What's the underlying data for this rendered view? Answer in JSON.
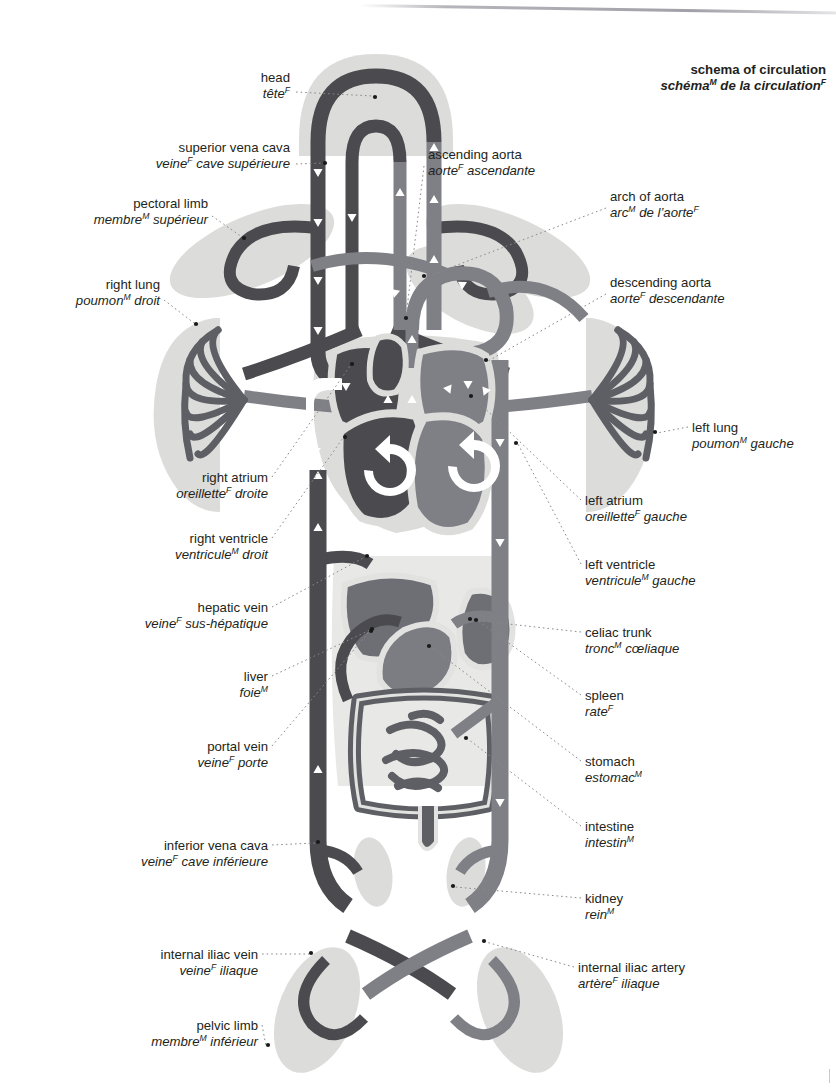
{
  "title": {
    "en": "schema of circulation",
    "fr_pre": "schéma",
    "fr_sup": "M",
    "fr_post": " de la circulation",
    "fr_sup2": "F"
  },
  "palette": {
    "vein": "#4a4a4f",
    "artery": "#7f7f86",
    "organ_dark": "#5c5c62",
    "organ_mid": "#77777e",
    "tissue": "#dcdcda",
    "tissue_light": "#e6e6e4",
    "outline_light": "#c9c9c6",
    "arrow": "#ffffff",
    "text": "#231f20",
    "background": "#ffffff",
    "leader": "#8a8a8a"
  },
  "labels_left": [
    {
      "name": "head",
      "en": "head",
      "fr": "tête",
      "sup": "F",
      "fr_pre": "",
      "x": 290,
      "y": 70,
      "dot_x": 375,
      "dot_y": 97
    },
    {
      "name": "superior-vena-cava",
      "en": "superior vena cava",
      "fr": "cave supérieure",
      "sup": "F",
      "fr_pre": "veine",
      "x": 290,
      "y": 140,
      "dot_x": 325,
      "dot_y": 163
    },
    {
      "name": "pectoral-limb",
      "en": "pectoral limb",
      "fr": "supérieur",
      "sup": "M",
      "fr_pre": "membre",
      "x": 208,
      "y": 196,
      "dot_x": 244,
      "dot_y": 238
    },
    {
      "name": "right-lung",
      "en": "right lung",
      "fr": "droit",
      "sup": "M",
      "fr_pre": "poumon",
      "x": 160,
      "y": 277,
      "dot_x": 196,
      "dot_y": 324
    },
    {
      "name": "right-atrium",
      "en": "right atrium",
      "fr": "droite",
      "sup": "F",
      "fr_pre": "oreillette",
      "x": 268,
      "y": 470,
      "dot_x": 352,
      "dot_y": 364
    },
    {
      "name": "right-ventricle",
      "en": "right ventricle",
      "fr": "droit",
      "sup": "M",
      "fr_pre": "ventricule",
      "x": 268,
      "y": 531,
      "dot_x": 345,
      "dot_y": 437
    },
    {
      "name": "hepatic-vein",
      "en": "hepatic vein",
      "fr": "sus-hépatique",
      "sup": "F",
      "fr_pre": "veine",
      "x": 268,
      "y": 600,
      "dot_x": 367,
      "dot_y": 556
    },
    {
      "name": "liver",
      "en": "liver",
      "fr": "foie",
      "sup": "M",
      "fr_pre": "",
      "x": 268,
      "y": 669,
      "dot_x": 372,
      "dot_y": 629
    },
    {
      "name": "portal-vein",
      "en": "portal vein",
      "fr": "porte",
      "sup": "F",
      "fr_pre": "veine",
      "x": 268,
      "y": 739,
      "dot_x": 371,
      "dot_y": 631
    },
    {
      "name": "inferior-vena-cava",
      "en": "inferior vena cava",
      "fr": "cave inférieure",
      "sup": "F",
      "fr_pre": "veine",
      "x": 268,
      "y": 838,
      "dot_x": 318,
      "dot_y": 842
    },
    {
      "name": "internal-iliac-vein",
      "en": "internal iliac vein",
      "fr": "iliaque",
      "sup": "F",
      "fr_pre": "veine",
      "x": 258,
      "y": 947,
      "dot_x": 311,
      "dot_y": 953
    },
    {
      "name": "pelvic-limb",
      "en": "pelvic limb",
      "fr": "inférieur",
      "sup": "M",
      "fr_pre": "membre",
      "x": 258,
      "y": 1018,
      "dot_x": 268,
      "dot_y": 1045
    }
  ],
  "labels_right": [
    {
      "name": "ascending-aorta",
      "en": "ascending aorta",
      "fr": "ascendante",
      "sup": "F",
      "fr_pre": "aorte",
      "x": 428,
      "y": 147,
      "dot_x": 406,
      "dot_y": 318
    },
    {
      "name": "arch-of-aorta",
      "en": "arch of aorta",
      "fr": "de l’aorte",
      "sup": "M",
      "fr_pre": "arc",
      "x": 610,
      "y": 189,
      "dot_x": 424,
      "dot_y": 276,
      "sup2": "F"
    },
    {
      "name": "descending-aorta",
      "en": "descending aorta",
      "fr": "descendante",
      "sup": "F",
      "fr_pre": "aorte",
      "x": 610,
      "y": 275,
      "dot_x": 486,
      "dot_y": 360
    },
    {
      "name": "left-lung",
      "en": "left lung",
      "fr": "gauche",
      "sup": "M",
      "fr_pre": "poumon",
      "x": 692,
      "y": 420,
      "dot_x": 655,
      "dot_y": 432
    },
    {
      "name": "left-atrium",
      "en": "left atrium",
      "fr": "gauche",
      "sup": "F",
      "fr_pre": "oreillette",
      "x": 585,
      "y": 493,
      "dot_x": 471,
      "dot_y": 396
    },
    {
      "name": "left-ventricle",
      "en": "left ventricle",
      "fr": "gauche",
      "sup": "M",
      "fr_pre": "ventricule",
      "x": 585,
      "y": 557,
      "dot_x": 516,
      "dot_y": 443
    },
    {
      "name": "celiac-trunk",
      "en": "celiac trunk",
      "fr": "cœliaque",
      "sup": "M",
      "fr_pre": "tronc",
      "x": 585,
      "y": 625,
      "dot_x": 470,
      "dot_y": 619
    },
    {
      "name": "spleen",
      "en": "spleen",
      "fr": "rate",
      "sup": "F",
      "fr_pre": "",
      "x": 585,
      "y": 688,
      "dot_x": 476,
      "dot_y": 620
    },
    {
      "name": "stomach",
      "en": "stomach",
      "fr": "estomac",
      "sup": "M",
      "fr_pre": "",
      "x": 585,
      "y": 754,
      "dot_x": 429,
      "dot_y": 646
    },
    {
      "name": "intestine",
      "en": "intestine",
      "fr": "intestin",
      "sup": "M",
      "fr_pre": "",
      "x": 585,
      "y": 819,
      "dot_x": 466,
      "dot_y": 738
    },
    {
      "name": "kidney",
      "en": "kidney",
      "fr": "rein",
      "sup": "M",
      "fr_pre": "",
      "x": 585,
      "y": 891,
      "dot_x": 453,
      "dot_y": 886
    },
    {
      "name": "internal-iliac-artery",
      "en": "internal iliac artery",
      "fr": "iliaque",
      "sup": "F",
      "fr_pre": "artère",
      "x": 578,
      "y": 960,
      "dot_x": 484,
      "dot_y": 941
    }
  ]
}
